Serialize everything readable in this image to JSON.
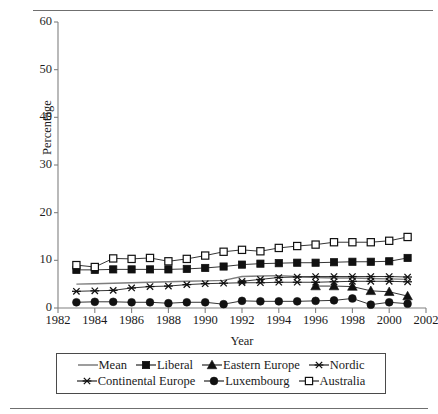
{
  "chart_data": {
    "type": "line",
    "title": "",
    "xlabel": "Year",
    "ylabel": "Percentage",
    "xlim": [
      1982,
      2002
    ],
    "ylim": [
      0,
      60
    ],
    "xticks": [
      1982,
      1984,
      1986,
      1988,
      1990,
      1992,
      1994,
      1996,
      1998,
      2000,
      2002
    ],
    "yticks": [
      0,
      10,
      20,
      30,
      40,
      50,
      60
    ],
    "grid": false,
    "legend_position": "below-axes",
    "x": [
      1983,
      1984,
      1985,
      1986,
      1987,
      1988,
      1989,
      1990,
      1991,
      1992,
      1993,
      1994,
      1995,
      1996,
      1997,
      1998,
      1999,
      2000,
      2001
    ],
    "series": [
      {
        "name": "Mean",
        "marker": "none",
        "color": "#7d7d7d",
        "values": [
          5.0,
          5.1,
          5.2,
          5.3,
          5.4,
          5.5,
          5.6,
          5.7,
          5.8,
          6.6,
          6.7,
          6.8,
          6.6,
          6.4,
          6.3,
          6.3,
          6.2,
          6.1,
          6.0
        ]
      },
      {
        "name": "Liberal",
        "marker": "filled-square",
        "color": "#111111",
        "values": [
          8.0,
          8.0,
          8.1,
          8.1,
          8.1,
          8.1,
          8.2,
          8.4,
          8.7,
          9.1,
          9.3,
          9.4,
          9.5,
          9.5,
          9.6,
          9.7,
          9.7,
          9.8,
          10.5
        ]
      },
      {
        "name": "Eastern Europe",
        "marker": "filled-triangle",
        "color": "#111111",
        "values": [
          null,
          null,
          null,
          null,
          null,
          null,
          null,
          null,
          null,
          null,
          null,
          null,
          null,
          4.6,
          4.6,
          4.5,
          3.6,
          3.4,
          2.5
        ]
      },
      {
        "name": "Nordic",
        "marker": "asterisk-cross",
        "color": "#111111",
        "values": [
          null,
          null,
          null,
          null,
          null,
          null,
          null,
          null,
          null,
          5.6,
          6.0,
          6.4,
          6.5,
          6.6,
          6.6,
          6.6,
          6.6,
          6.6,
          6.5
        ]
      },
      {
        "name": "Continental Europe",
        "marker": "asterisk-cross",
        "color": "#111111",
        "values": [
          3.5,
          3.6,
          3.7,
          4.2,
          4.5,
          4.6,
          4.9,
          5.1,
          5.2,
          5.3,
          5.3,
          5.4,
          5.4,
          5.4,
          5.5,
          5.6,
          5.6,
          5.6,
          5.5
        ]
      },
      {
        "name": "Luxembourg",
        "marker": "filled-circle",
        "color": "#111111",
        "values": [
          1.2,
          1.3,
          1.3,
          1.2,
          1.2,
          1.0,
          1.2,
          1.2,
          0.8,
          1.5,
          1.4,
          1.4,
          1.4,
          1.5,
          1.6,
          2.0,
          0.7,
          1.2,
          0.9
        ]
      },
      {
        "name": "Australia",
        "marker": "open-square",
        "color": "#111111",
        "values": [
          9.0,
          8.6,
          10.4,
          10.3,
          10.5,
          9.8,
          10.3,
          11.0,
          11.8,
          12.2,
          11.9,
          12.6,
          13.0,
          13.3,
          13.8,
          13.8,
          13.8,
          14.1,
          14.9
        ]
      }
    ]
  },
  "legend": {
    "rows": [
      [
        {
          "label": "Mean",
          "marker": "none"
        },
        {
          "label": "Liberal",
          "marker": "filled-square"
        },
        {
          "label": "Eastern Europe",
          "marker": "filled-triangle"
        },
        {
          "label": "Nordic",
          "marker": "asterisk-cross"
        }
      ],
      [
        {
          "label": "Continental Europe",
          "marker": "asterisk-cross"
        },
        {
          "label": "Luxembourg",
          "marker": "filled-circle"
        },
        {
          "label": "Australia",
          "marker": "open-square"
        }
      ]
    ]
  }
}
